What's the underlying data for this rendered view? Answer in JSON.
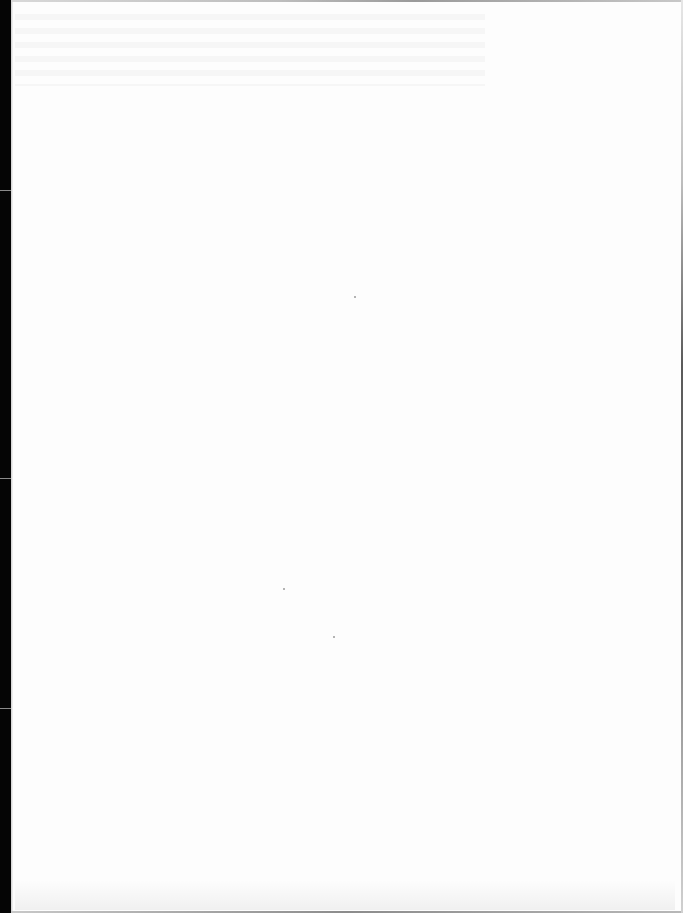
{
  "document": {
    "type": "scanned-page",
    "state": "blank",
    "text": "",
    "colors": {
      "paper": "#fdfdfd",
      "binding_strip": "#050505",
      "border": "#6a6a6a",
      "noise": "#9a9a9a"
    }
  }
}
